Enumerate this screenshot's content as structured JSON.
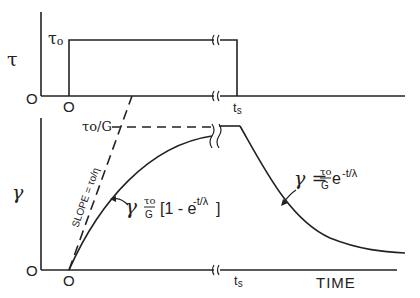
{
  "top_plot": {
    "y_axis_label": "τ",
    "level_label": "τ",
    "level_sub": "o",
    "origin_y_label": "O",
    "origin_x_label": "O",
    "ts_label": "t",
    "ts_sub": "s"
  },
  "bottom_plot": {
    "y_axis_label": "γ",
    "plateau_label": "τo/G",
    "origin_y_label": "O",
    "origin_x_label": "O",
    "ts_label": "t",
    "ts_sub": "s",
    "x_axis_label": "TIME",
    "slope_label": "SLOPE = τo/η",
    "rise_eq": {
      "lhs": "γ",
      "num": "τo",
      "den": "G",
      "body": "[1 - e",
      "exp": "-t/λ",
      "close": "]"
    },
    "decay_eq": {
      "lhs": "γ =",
      "num": "τo",
      "den": "G",
      "body": "e",
      "exp": "-t/λ"
    }
  }
}
